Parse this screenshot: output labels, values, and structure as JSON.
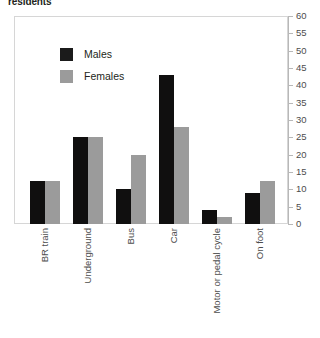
{
  "chart_data": {
    "type": "bar",
    "title": "residents",
    "xlabel": "",
    "ylabel": "",
    "ylim": [
      0,
      60
    ],
    "yticks": [
      0,
      5,
      10,
      15,
      20,
      25,
      30,
      35,
      40,
      45,
      50,
      55,
      60
    ],
    "grid": false,
    "legend_position": "upper-left-inside",
    "axis_side": "right",
    "categories": [
      "BR train",
      "Underground",
      "Bus",
      "Car",
      "Motor or pedal cycle",
      "On foot"
    ],
    "series": [
      {
        "name": "Males",
        "color": "#100f0f",
        "values": [
          12.5,
          25,
          10,
          43,
          4,
          9
        ]
      },
      {
        "name": "Females",
        "color": "#9b9b9b",
        "values": [
          12.5,
          25,
          20,
          28,
          2,
          12.5
        ]
      }
    ]
  },
  "legend": {
    "items": [
      {
        "label": "Males",
        "swatch": "males"
      },
      {
        "label": "Females",
        "swatch": "females"
      }
    ]
  }
}
